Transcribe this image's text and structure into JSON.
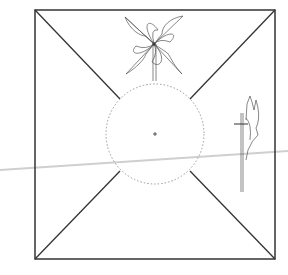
{
  "diagram": {
    "title": "",
    "colors": {
      "background": "#ffffff",
      "frame": "#333333",
      "diagonals": "#333333",
      "circle": "#999999",
      "pinwheel": "#555555",
      "scan_line": "#cccccc"
    },
    "frame": {
      "x": 35,
      "y": 10,
      "width": 240,
      "height": 249
    },
    "center_circle": {
      "cx": 155,
      "cy": 134,
      "r": 49,
      "style": "dotted"
    },
    "center_mark": {
      "cx": 155,
      "cy": 134
    },
    "pinwheel_front": {
      "cx": 154,
      "cy": 44,
      "label": ""
    },
    "pinwheel_side": {
      "x": 242,
      "y": 95,
      "label": ""
    }
  }
}
